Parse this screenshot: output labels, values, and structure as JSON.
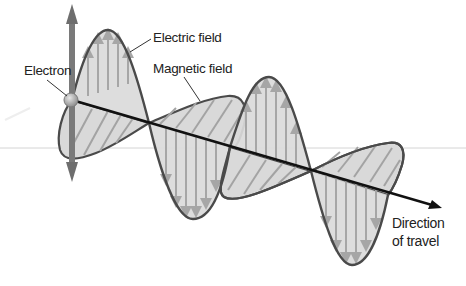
{
  "diagram": {
    "labels": {
      "electron": "Electron",
      "electric_field": "Electric field",
      "magnetic_field": "Magnetic field",
      "direction_line1": "Direction",
      "direction_line2": "of travel"
    },
    "colors": {
      "fill": "#d9d9d9",
      "outline": "#4a4a4a",
      "axis": "#111111",
      "field_arrows": "#a6a6a6",
      "electron": "#9a9a9a",
      "oscillation_arrow": "#6e6e6e",
      "reference_line": "#cfcfcf"
    },
    "components": [
      {
        "name": "electron",
        "description": "oscillating charged particle at wave origin"
      },
      {
        "name": "electric-field",
        "description": "sinusoidal wave in vertical plane, vertical arrows"
      },
      {
        "name": "magnetic-field",
        "description": "sinusoidal wave in horizontal plane, diagonal hatch arrows"
      },
      {
        "name": "direction-axis",
        "description": "arrow showing direction of propagation"
      }
    ]
  }
}
